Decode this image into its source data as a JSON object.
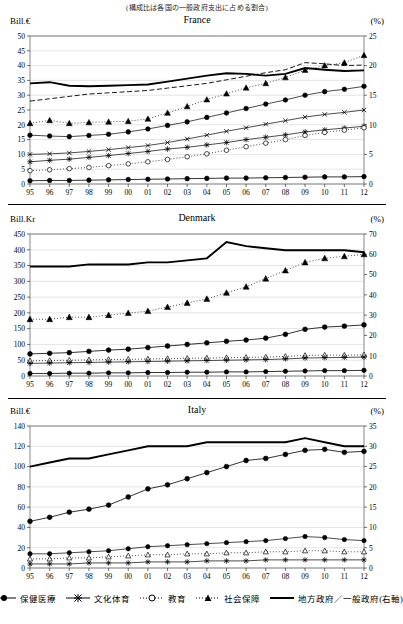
{
  "top_note": "(構成比は各国の一般政府支出に占める割合)",
  "legend": [
    {
      "key": "health",
      "label": "保健医療"
    },
    {
      "key": "culture",
      "label": "文化体育"
    },
    {
      "key": "education",
      "label": "教育"
    },
    {
      "key": "social",
      "label": "社会保障"
    },
    {
      "key": "localshare",
      "label": "地方政府／一般政府(右軸)"
    }
  ],
  "panels": [
    {
      "title": "France",
      "ylabel_left": "Bill.€",
      "ylabel_right": "(%)",
      "chart_data": {
        "type": "line",
        "title": "France",
        "xlabel": "",
        "ylabel": "Bill.€",
        "ylabel_right": "(%)",
        "ylim": [
          0,
          50
        ],
        "ylim_right": [
          0,
          25
        ],
        "yticks": [
          0,
          5,
          10,
          15,
          20,
          25,
          30,
          35,
          40,
          45,
          50
        ],
        "yticks_right": [
          0,
          5,
          10,
          15,
          20,
          25
        ],
        "grid": true,
        "legend_position": "bottom",
        "categories": [
          "95",
          "96",
          "97",
          "98",
          "99",
          "00",
          "01",
          "02",
          "03",
          "04",
          "05",
          "06",
          "07",
          "08",
          "09",
          "10",
          "11",
          "12"
        ],
        "series": [
          {
            "name": "保健医療",
            "axis": "left",
            "values": [
              1.1,
              1.2,
              1.2,
              1.3,
              1.4,
              1.5,
              1.6,
              1.7,
              1.8,
              1.9,
              2.0,
              2.0,
              2.1,
              2.2,
              2.3,
              2.4,
              2.4,
              2.5
            ]
          },
          {
            "name": "文化体育",
            "axis": "left",
            "values": [
              7.5,
              8.0,
              8.4,
              9.0,
              9.6,
              10.3,
              11.0,
              11.8,
              12.4,
              13.2,
              14.0,
              15.0,
              15.8,
              16.6,
              17.6,
              18.3,
              18.9,
              19.5
            ]
          },
          {
            "name": "教育",
            "axis": "left",
            "values": [
              16.5,
              16.2,
              16.0,
              16.4,
              16.8,
              17.6,
              18.6,
              19.8,
              21.0,
              22.5,
              24.0,
              25.5,
              27.0,
              28.4,
              30.0,
              31.2,
              32.0,
              33.0
            ]
          },
          {
            "name": "社会保障",
            "axis": "left",
            "values": [
              20.5,
              21.5,
              20.5,
              20.8,
              21.0,
              21.2,
              22.0,
              24.0,
              26.2,
              28.5,
              30.5,
              32.5,
              34.0,
              36.0,
              38.5,
              40.0,
              41.0,
              43.5
            ]
          },
          {
            "name": "地方政府／一般政府(右軸)",
            "axis": "right",
            "values": [
              17.0,
              17.2,
              16.6,
              16.5,
              16.6,
              16.7,
              16.8,
              17.3,
              17.8,
              18.3,
              18.7,
              18.6,
              18.3,
              18.6,
              19.6,
              19.3,
              19.1,
              19.2
            ]
          },
          {
            "name": "補助系列A",
            "axis": "left",
            "values": [
              10.0,
              10.2,
              10.5,
              11.0,
              11.6,
              12.3,
              13.0,
              14.0,
              15.2,
              16.5,
              17.8,
              19.0,
              20.2,
              21.4,
              22.6,
              23.5,
              24.2,
              25.0
            ]
          },
          {
            "name": "補助系列B",
            "axis": "left",
            "values": [
              4.5,
              4.8,
              5.2,
              5.6,
              6.2,
              6.8,
              7.5,
              8.3,
              9.2,
              10.2,
              11.4,
              12.6,
              13.8,
              15.0,
              16.4,
              17.4,
              18.2,
              19.0
            ]
          },
          {
            "name": "破線(右軸)",
            "axis": "right",
            "values": [
              14.0,
              14.4,
              14.8,
              15.2,
              15.4,
              15.6,
              15.8,
              16.2,
              16.6,
              17.0,
              17.6,
              18.2,
              18.8,
              19.3,
              20.5,
              20.3,
              20.0,
              20.1
            ]
          }
        ]
      }
    },
    {
      "title": "Denmark",
      "ylabel_left": "Bill.Kr",
      "ylabel_right": "(%)",
      "chart_data": {
        "type": "line",
        "title": "Denmark",
        "xlabel": "",
        "ylabel": "Bill.Kr",
        "ylabel_right": "(%)",
        "ylim": [
          0,
          450
        ],
        "ylim_right": [
          0,
          70
        ],
        "yticks": [
          0,
          50,
          100,
          150,
          200,
          250,
          300,
          350,
          400,
          450
        ],
        "yticks_right": [
          0,
          10,
          20,
          30,
          40,
          50,
          60,
          70
        ],
        "grid": true,
        "legend_position": "bottom",
        "categories": [
          "95",
          "96",
          "97",
          "98",
          "99",
          "00",
          "01",
          "02",
          "03",
          "04",
          "05",
          "06",
          "07",
          "08",
          "09",
          "10",
          "11",
          "12"
        ],
        "series": [
          {
            "name": "保健医療",
            "axis": "left",
            "values": [
              70,
              72,
              74,
              78,
              82,
              85,
              90,
              95,
              100,
              105,
              110,
              114,
              120,
              132,
              148,
              155,
              158,
              162
            ]
          },
          {
            "name": "文化体育",
            "axis": "left",
            "values": [
              48,
              49,
              50,
              51,
              52,
              53,
              54,
              55,
              56,
              57,
              58,
              59,
              60,
              62,
              65,
              66,
              66,
              67
            ]
          },
          {
            "name": "教育",
            "axis": "left",
            "values": [
              40,
              41,
              42,
              43,
              44,
              45,
              46,
              47,
              48,
              49,
              50,
              51,
              52,
              54,
              57,
              58,
              59,
              60
            ]
          },
          {
            "name": "社会保障",
            "axis": "left",
            "values": [
              8,
              8,
              9,
              9,
              10,
              10,
              11,
              11,
              12,
              12,
              13,
              13,
              14,
              15,
              16,
              17,
              17,
              18
            ]
          },
          {
            "name": "地方政府／一般政府(右軸)",
            "axis": "right",
            "values": [
              54,
              54,
              54,
              55,
              55,
              55,
              56,
              56,
              57,
              58,
              66,
              64,
              63,
              62,
              62,
              62,
              62,
              61
            ]
          },
          {
            "name": "破線三角(右軸)",
            "axis": "right",
            "values": [
              28,
              28,
              29,
              29,
              30,
              31,
              32,
              34,
              36,
              38,
              41,
              44,
              48,
              52,
              56,
              58,
              59,
              60
            ]
          }
        ]
      }
    },
    {
      "title": "Italy",
      "ylabel_left": "Bill.€",
      "ylabel_right": "(%)",
      "chart_data": {
        "type": "line",
        "title": "Italy",
        "xlabel": "",
        "ylabel": "Bill.€",
        "ylabel_right": "(%)",
        "ylim": [
          0,
          140
        ],
        "ylim_right": [
          0,
          35
        ],
        "yticks": [
          0,
          20,
          40,
          60,
          80,
          100,
          120,
          140
        ],
        "yticks_right": [
          0,
          5,
          10,
          15,
          20,
          25,
          30,
          35
        ],
        "grid": true,
        "legend_position": "bottom",
        "categories": [
          "95",
          "96",
          "97",
          "98",
          "99",
          "00",
          "01",
          "02",
          "03",
          "04",
          "05",
          "06",
          "07",
          "08",
          "09",
          "10",
          "11",
          "12"
        ],
        "series": [
          {
            "name": "保健医療",
            "axis": "left",
            "values": [
              46,
              50,
              55,
              58,
              62,
              70,
              78,
              82,
              88,
              94,
              100,
              106,
              108,
              112,
              116,
              117,
              114,
              115
            ]
          },
          {
            "name": "文化体育",
            "axis": "left",
            "values": [
              14,
              14,
              15,
              16,
              17,
              19,
              21,
              22,
              23,
              24,
              25,
              26,
              27,
              29,
              31,
              30,
              28,
              27
            ]
          },
          {
            "name": "教育",
            "axis": "left",
            "values": [
              9,
              9,
              10,
              10,
              11,
              12,
              13,
              13,
              14,
              14,
              15,
              15,
              16,
              16,
              17,
              17,
              16,
              16
            ]
          },
          {
            "name": "社会保障",
            "axis": "left",
            "values": [
              4,
              4,
              4,
              5,
              5,
              5,
              6,
              6,
              6,
              7,
              7,
              7,
              8,
              8,
              8,
              8,
              8,
              8
            ]
          },
          {
            "name": "地方政府／一般政府(右軸)",
            "axis": "right",
            "values": [
              25,
              26,
              27,
              27,
              28,
              29,
              30,
              30,
              30,
              31,
              31,
              31,
              31,
              31,
              32,
              31,
              30,
              30
            ]
          }
        ]
      }
    }
  ]
}
